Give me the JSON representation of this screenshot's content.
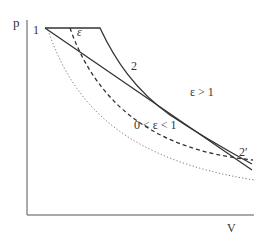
{
  "diagram": {
    "type": "p-V diagram",
    "axes": {
      "y_label": "p",
      "x_label": "V"
    },
    "points": {
      "start": "1",
      "intersection": "2",
      "end": "2′"
    },
    "annotations": {
      "epsilon": "ε",
      "epsilon_gt_1": "ε > 1",
      "epsilon_between": "0 < ε < 1"
    },
    "curves": [
      {
        "name": "isobar-then-curve",
        "style": "solid"
      },
      {
        "name": "straight-line",
        "style": "solid"
      },
      {
        "name": "dashed-curve",
        "style": "dashed"
      },
      {
        "name": "dotted-curve",
        "style": "dotted"
      }
    ],
    "colors": {
      "line": "#333333",
      "dotted": "#777777"
    }
  }
}
